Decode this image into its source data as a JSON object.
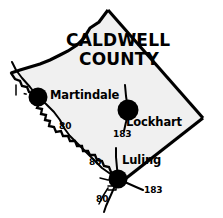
{
  "map": {
    "title_line1": "CALDWELL",
    "title_line2": "COUNTY",
    "colors": {
      "background": "#ffffff",
      "county_fill": "#f0f0f0",
      "ink": "#000000"
    },
    "cities": [
      {
        "name": "Martindale",
        "dot_x": 38,
        "dot_y": 97,
        "dot_r": 9.5,
        "label_x": 50,
        "label_y": 91
      },
      {
        "name": "Lockhart",
        "dot_x": 128,
        "dot_y": 110,
        "dot_r": 10.5,
        "label_x": 126,
        "label_y": 118
      },
      {
        "name": "Luling",
        "dot_x": 118,
        "dot_y": 179,
        "dot_r": 9.5,
        "label_x": 122,
        "label_y": 159
      }
    ],
    "highway_labels": [
      {
        "route": "80",
        "x": 59,
        "y": 127
      },
      {
        "route": "183",
        "x": 113,
        "y": 134
      },
      {
        "route": "80",
        "x": 89,
        "y": 162
      },
      {
        "route": "183",
        "x": 144,
        "y": 189
      },
      {
        "route": "80",
        "x": 96,
        "y": 198
      }
    ],
    "title_line1_x": 66,
    "title_line1_y": 41,
    "title_line2_x": 79,
    "title_line2_y": 60
  }
}
